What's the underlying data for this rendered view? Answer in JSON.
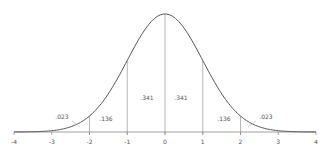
{
  "chart_data": {
    "type": "area",
    "title": "",
    "xlabel": "",
    "ylabel": "",
    "distribution": "standard normal",
    "xlim": [
      -4,
      4
    ],
    "x_ticks": [
      -4,
      -3,
      -2,
      -1,
      0,
      1,
      2,
      3,
      4
    ],
    "x_tick_labels": [
      "-4",
      "-3",
      "-2",
      "-1",
      "0",
      "1",
      "2",
      "3",
      "4"
    ],
    "vertical_lines_at": [
      -2,
      -1,
      0,
      1,
      2
    ],
    "grid": false,
    "legend": null,
    "regions": [
      {
        "from": -4,
        "to": -2,
        "label": ".023"
      },
      {
        "from": -2,
        "to": -1,
        "label": ".136"
      },
      {
        "from": -1,
        "to": 0,
        "label": ".341"
      },
      {
        "from": 0,
        "to": 1,
        "label": ".341"
      },
      {
        "from": 1,
        "to": 2,
        "label": ".136"
      },
      {
        "from": 2,
        "to": 4,
        "label": ".023"
      }
    ],
    "colors": {
      "curve": "#555555",
      "axis": "#888888",
      "lines": "#999999",
      "leader": "#aaaaaa"
    }
  }
}
